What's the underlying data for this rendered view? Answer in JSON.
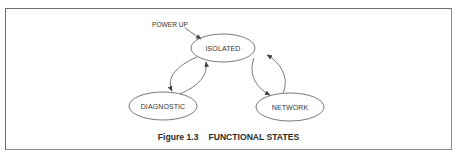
{
  "figure": {
    "number": "Figure 1.3",
    "title": "FUNCTIONAL STATES"
  },
  "diagram": {
    "entry_label": "POWER UP",
    "states": [
      {
        "id": "isolated",
        "label": "ISOLATED"
      },
      {
        "id": "diagnostic",
        "label": "DIAGNOSTIC"
      },
      {
        "id": "network",
        "label": "NETWORK"
      }
    ],
    "transitions": [
      {
        "from": "power-up",
        "to": "isolated"
      },
      {
        "from": "isolated",
        "to": "diagnostic"
      },
      {
        "from": "diagnostic",
        "to": "isolated"
      },
      {
        "from": "isolated",
        "to": "network"
      },
      {
        "from": "network",
        "to": "isolated"
      }
    ],
    "colors": {
      "stroke": "#555555",
      "text": "#333333",
      "frame": "#6e6e6e"
    }
  }
}
